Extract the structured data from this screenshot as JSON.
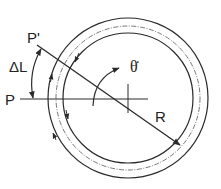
{
  "diagram": {
    "labels": {
      "p_prime": "P'",
      "p": "P",
      "delta_l": "ΔL",
      "theta_dot": "θ̇",
      "radius": "R"
    },
    "colors": {
      "stroke": "#2a2a2a",
      "background": "#ffffff"
    },
    "geometry": {
      "center": [
        128,
        98
      ],
      "outer_ring_radius": 80,
      "dashed_path_radius": 72,
      "inner_ring_radius": 65
    }
  }
}
